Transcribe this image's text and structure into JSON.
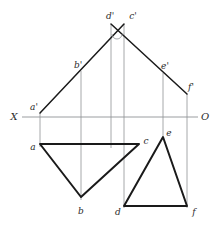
{
  "drawing": {
    "title": "Orthographic projection of two triangles",
    "background": "#ffffff",
    "colors": {
      "solid_edge": "#1a1a1a",
      "projection_line": "#8f9295",
      "ground_line": "#8f9295",
      "label": "#2b2b2b"
    },
    "ground_line": {
      "y": 117,
      "x_start": 22,
      "x_end": 198,
      "left_label": "X",
      "right_label": "O"
    },
    "labels": [
      {
        "id": "X",
        "text": "X",
        "x": 14,
        "y": 117,
        "size": "big"
      },
      {
        "id": "O",
        "text": "O",
        "x": 205,
        "y": 117,
        "size": "big"
      },
      {
        "id": "ap",
        "text": "a'",
        "x": 34,
        "y": 107,
        "size": "small"
      },
      {
        "id": "bp",
        "text": "b'",
        "x": 78,
        "y": 65,
        "size": "small"
      },
      {
        "id": "dp",
        "text": "d'",
        "x": 110,
        "y": 16,
        "size": "small"
      },
      {
        "id": "cp",
        "text": "c'",
        "x": 133,
        "y": 16,
        "size": "small"
      },
      {
        "id": "ep",
        "text": "e'",
        "x": 165,
        "y": 66,
        "size": "small"
      },
      {
        "id": "fp",
        "text": "f'",
        "x": 191,
        "y": 87,
        "size": "small"
      },
      {
        "id": "a",
        "text": "a",
        "x": 33,
        "y": 147,
        "size": "small"
      },
      {
        "id": "c",
        "text": "c",
        "x": 146,
        "y": 141,
        "size": "small"
      },
      {
        "id": "e",
        "text": "e",
        "x": 169,
        "y": 133,
        "size": "small"
      },
      {
        "id": "b",
        "text": "b",
        "x": 81,
        "y": 211,
        "size": "small"
      },
      {
        "id": "d",
        "text": "d",
        "x": 118,
        "y": 212,
        "size": "small"
      },
      {
        "id": "f",
        "text": "f",
        "x": 194,
        "y": 212,
        "size": "small"
      }
    ],
    "points": {
      "a_front": {
        "x": 40,
        "y": 113
      },
      "b_front": {
        "x": 81,
        "y": 71
      },
      "d_front": {
        "x": 111,
        "y": 24
      },
      "c_front": {
        "x": 124,
        "y": 24
      },
      "e_front": {
        "x": 163,
        "y": 73
      },
      "f_front": {
        "x": 187,
        "y": 94
      },
      "a_top": {
        "x": 40,
        "y": 144
      },
      "c_top": {
        "x": 139,
        "y": 144
      },
      "b_top": {
        "x": 81,
        "y": 197
      },
      "e_top": {
        "x": 163,
        "y": 137
      },
      "d_top": {
        "x": 124,
        "y": 206
      },
      "f_top": {
        "x": 187,
        "y": 206
      }
    },
    "front_view_edges": [
      {
        "name": "a'-d'",
        "x1": 40,
        "y1": 113,
        "x2": 124,
        "y2": 24
      },
      {
        "name": "c'-f'",
        "x1": 111,
        "y1": 24,
        "x2": 187,
        "y2": 94
      }
    ],
    "top_view_triangles": [
      {
        "name": "triangle-abc",
        "points": "40,144 139,144 81,197"
      },
      {
        "name": "triangle-def",
        "points": "163,137 187,206 124,206"
      }
    ],
    "projection_lines": [
      {
        "name": "proj-a",
        "x": 40,
        "y1": 113,
        "y2": 147
      },
      {
        "name": "proj-b",
        "x": 81,
        "y1": 71,
        "y2": 200
      },
      {
        "name": "proj-d-front",
        "x": 111,
        "y1": 24,
        "y2": 148
      },
      {
        "name": "proj-c",
        "x": 124,
        "y1": 24,
        "y2": 148
      },
      {
        "name": "proj-d-top",
        "x": 124,
        "y1": 148,
        "y2": 208
      },
      {
        "name": "proj-e",
        "x": 163,
        "y1": 73,
        "y2": 140
      },
      {
        "name": "proj-f",
        "x": 187,
        "y1": 94,
        "y2": 208
      }
    ],
    "angle_marker": {
      "cx": 117,
      "cy": 34,
      "r": 5
    }
  }
}
